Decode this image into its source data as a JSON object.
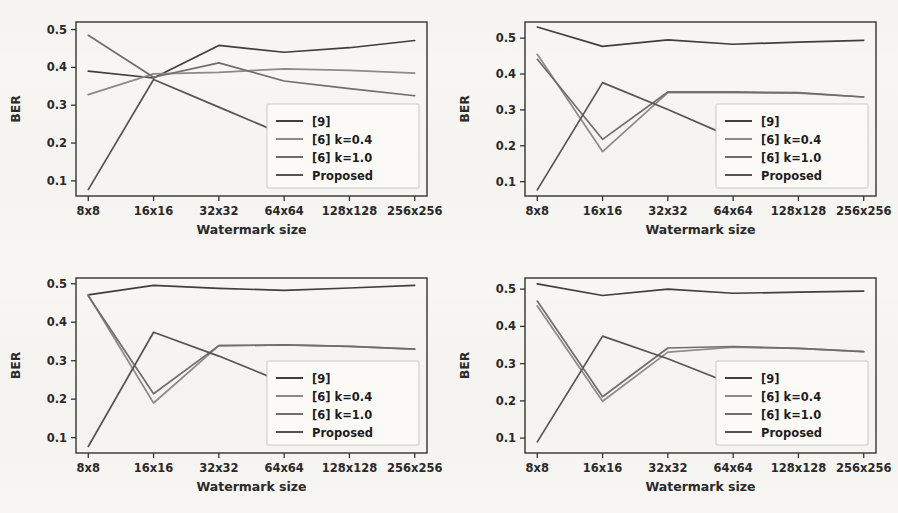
{
  "figure": {
    "background_color": "#f7f6f2",
    "panel_count": 4,
    "shared": {
      "xlabel": "Watermark size",
      "ylabel": "BER",
      "categories": [
        "8x8",
        "16x16",
        "32x32",
        "64x64",
        "128x128",
        "256x256"
      ],
      "yticks": [
        "0.1",
        "0.2",
        "0.3",
        "0.4",
        "0.5"
      ],
      "ylim": [
        0.06,
        0.52
      ],
      "legend_position": "lower right",
      "legend_entries": [
        {
          "label": "[9]",
          "color": "#3f3f3f"
        },
        {
          "label": "[6] k=0.4",
          "color": "#8a8a8a"
        },
        {
          "label": "[6] k=1.0",
          "color": "#6e6e6e"
        },
        {
          "label": "Proposed",
          "color": "#555555"
        }
      ]
    }
  },
  "chart_data": [
    {
      "type": "line",
      "panel": "top-left",
      "title": "",
      "xlabel": "Watermark size",
      "ylabel": "BER",
      "categories": [
        "8x8",
        "16x16",
        "32x32",
        "64x64",
        "128x128",
        "256x256"
      ],
      "ylim": [
        0.06,
        0.52
      ],
      "yticks": [
        0.1,
        0.2,
        0.3,
        0.4,
        0.5
      ],
      "grid": false,
      "legend": [
        "[9]",
        "[6] k=0.4",
        "[6] k=1.0",
        "Proposed"
      ],
      "series": [
        {
          "name": "[9]",
          "color": "#3f3f3f",
          "values": [
            0.39,
            0.372,
            0.458,
            0.44,
            0.452,
            0.471
          ]
        },
        {
          "name": "[6] k=0.4",
          "color": "#8a8a8a",
          "values": [
            0.328,
            0.383,
            0.387,
            0.396,
            0.392,
            0.385
          ]
        },
        {
          "name": "[6] k=1.0",
          "color": "#6e6e6e",
          "values": [
            0.485,
            0.374,
            0.412,
            0.364,
            0.344,
            0.325
          ]
        },
        {
          "name": "Proposed",
          "color": "#555555",
          "values": [
            0.077,
            0.368,
            0.295,
            0.222,
            0.162,
            0.124
          ]
        }
      ]
    },
    {
      "type": "line",
      "panel": "top-right",
      "title": "",
      "xlabel": "Watermark size",
      "ylabel": "BER",
      "categories": [
        "8x8",
        "16x16",
        "32x32",
        "64x64",
        "128x128",
        "256x256"
      ],
      "ylim": [
        0.06,
        0.545
      ],
      "yticks": [
        0.1,
        0.2,
        0.3,
        0.4,
        0.5
      ],
      "grid": false,
      "legend": [
        "[9]",
        "[6] k=0.4",
        "[6] k=1.0",
        "Proposed"
      ],
      "series": [
        {
          "name": "[9]",
          "color": "#3f3f3f",
          "values": [
            0.531,
            0.477,
            0.495,
            0.483,
            0.489,
            0.494
          ]
        },
        {
          "name": "[6] k=0.4",
          "color": "#8a8a8a",
          "values": [
            0.455,
            0.184,
            0.348,
            0.348,
            0.347,
            0.336
          ]
        },
        {
          "name": "[6] k=1.0",
          "color": "#6e6e6e",
          "values": [
            0.441,
            0.218,
            0.35,
            0.35,
            0.348,
            0.336
          ]
        },
        {
          "name": "Proposed",
          "color": "#555555",
          "values": [
            0.077,
            0.376,
            0.301,
            0.222,
            0.161,
            0.125
          ]
        }
      ]
    },
    {
      "type": "line",
      "panel": "bottom-left",
      "title": "",
      "xlabel": "Watermark size",
      "ylabel": "BER",
      "categories": [
        "8x8",
        "16x16",
        "32x32",
        "64x64",
        "128x128",
        "256x256"
      ],
      "ylim": [
        0.06,
        0.515
      ],
      "yticks": [
        0.1,
        0.2,
        0.3,
        0.4,
        0.5
      ],
      "grid": false,
      "legend": [
        "[9]",
        "[6] k=0.4",
        "[6] k=1.0",
        "Proposed"
      ],
      "series": [
        {
          "name": "[9]",
          "color": "#3f3f3f",
          "values": [
            0.471,
            0.496,
            0.488,
            0.483,
            0.489,
            0.496
          ]
        },
        {
          "name": "[6] k=0.4",
          "color": "#8a8a8a",
          "values": [
            0.47,
            0.19,
            0.339,
            0.341,
            0.337,
            0.33
          ]
        },
        {
          "name": "[6] k=1.0",
          "color": "#6e6e6e",
          "values": [
            0.468,
            0.214,
            0.339,
            0.341,
            0.337,
            0.33
          ]
        },
        {
          "name": "Proposed",
          "color": "#555555",
          "values": [
            0.077,
            0.374,
            0.312,
            0.243,
            0.162,
            0.124
          ]
        }
      ]
    },
    {
      "type": "line",
      "panel": "bottom-right",
      "title": "",
      "xlabel": "Watermark size",
      "ylabel": "BER",
      "categories": [
        "8x8",
        "16x16",
        "32x32",
        "64x64",
        "128x128",
        "256x256"
      ],
      "ylim": [
        0.06,
        0.53
      ],
      "yticks": [
        0.1,
        0.2,
        0.3,
        0.4,
        0.5
      ],
      "grid": false,
      "legend": [
        "[9]",
        "[6] k=0.4",
        "[6] k=1.0",
        "Proposed"
      ],
      "series": [
        {
          "name": "[9]",
          "color": "#3f3f3f",
          "values": [
            0.514,
            0.483,
            0.5,
            0.489,
            0.492,
            0.495
          ]
        },
        {
          "name": "[6] k=0.4",
          "color": "#8a8a8a",
          "values": [
            0.455,
            0.199,
            0.331,
            0.344,
            0.341,
            0.332
          ]
        },
        {
          "name": "[6] k=1.0",
          "color": "#6e6e6e",
          "values": [
            0.468,
            0.211,
            0.342,
            0.346,
            0.341,
            0.332
          ]
        },
        {
          "name": "Proposed",
          "color": "#555555",
          "values": [
            0.09,
            0.374,
            0.313,
            0.244,
            0.162,
            0.126
          ]
        }
      ]
    }
  ]
}
